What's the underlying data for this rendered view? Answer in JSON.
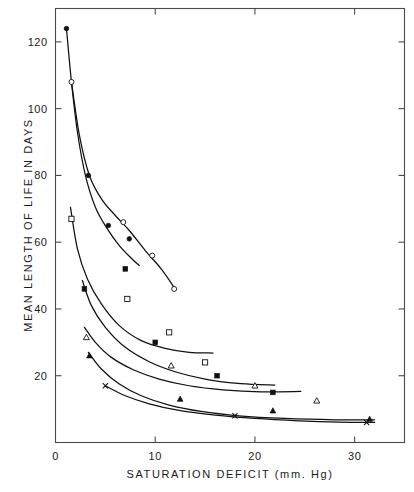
{
  "chart_data": {
    "type": "scatter",
    "title": "",
    "xlabel": "SATURATION DEFICIT  (mm. Hg)",
    "ylabel": "MEAN LENGTH OF LIFE IN DAYS",
    "xlim": [
      0,
      35
    ],
    "ylim": [
      0,
      130
    ],
    "grid": false,
    "legend": "none",
    "xticks": [
      0,
      10,
      20,
      30
    ],
    "xtick_labels": [
      "0",
      "10",
      "20",
      "30"
    ],
    "yticks": [
      20,
      40,
      60,
      80,
      100,
      120
    ],
    "ytick_labels": [
      "20",
      "40",
      "60",
      "80",
      "100",
      "120"
    ],
    "series": [
      {
        "name": "series-1",
        "marker": "filled-circle",
        "x": [
          1.1,
          3.3,
          5.3,
          7.4
        ],
        "y": [
          124.0,
          80.0,
          65.0,
          61.0
        ]
      },
      {
        "name": "series-2",
        "marker": "open-circle",
        "x": [
          1.6,
          6.8,
          9.7,
          11.9
        ],
        "y": [
          108.0,
          66.0,
          56.0,
          46.0
        ]
      },
      {
        "name": "series-3",
        "marker": "open-square",
        "x": [
          1.6,
          7.2,
          11.4,
          15.0
        ],
        "y": [
          67.0,
          43.0,
          33.0,
          24.0
        ]
      },
      {
        "name": "series-4",
        "marker": "filled-square",
        "x": [
          2.9,
          7.0,
          10.0,
          16.2,
          21.8
        ],
        "y": [
          46.0,
          52.0,
          30.0,
          20.0,
          15.0
        ]
      },
      {
        "name": "series-5",
        "marker": "open-triangle",
        "x": [
          3.1,
          11.6,
          20.0,
          26.2
        ],
        "y": [
          31.5,
          23.0,
          17.0,
          12.5
        ]
      },
      {
        "name": "series-6",
        "marker": "filled-triangle",
        "x": [
          3.4,
          12.5,
          21.8,
          31.5
        ],
        "y": [
          26.0,
          13.0,
          9.5,
          7.0
        ]
      },
      {
        "name": "series-7",
        "marker": "cross",
        "x": [
          5.0,
          18.0,
          31.2
        ],
        "y": [
          17.0,
          8.0,
          6.0
        ]
      }
    ],
    "curves": [
      {
        "name": "curve-1",
        "points": [
          [
            1.1,
            124.0
          ],
          [
            1.6,
            108.0
          ],
          [
            2.2,
            93.0
          ],
          [
            3.0,
            80.0
          ],
          [
            4.0,
            70.5
          ],
          [
            5.2,
            64.0
          ],
          [
            6.4,
            59.0
          ],
          [
            7.6,
            55.2
          ],
          [
            8.4,
            53.0
          ]
        ]
      },
      {
        "name": "curve-2",
        "points": [
          [
            1.6,
            108.0
          ],
          [
            2.4,
            92.0
          ],
          [
            3.4,
            80.0
          ],
          [
            4.6,
            73.0
          ],
          [
            6.0,
            68.0
          ],
          [
            7.4,
            63.5
          ],
          [
            9.0,
            57.5
          ],
          [
            10.6,
            52.0
          ],
          [
            12.0,
            46.0
          ]
        ]
      },
      {
        "name": "curve-3",
        "points": [
          [
            1.5,
            70.5
          ],
          [
            2.2,
            58.0
          ],
          [
            3.2,
            49.0
          ],
          [
            4.6,
            41.5
          ],
          [
            6.4,
            35.0
          ],
          [
            8.6,
            30.5
          ],
          [
            11.0,
            28.2
          ],
          [
            13.4,
            27.0
          ],
          [
            15.8,
            26.8
          ]
        ]
      },
      {
        "name": "curve-4",
        "points": [
          [
            2.7,
            48.5
          ],
          [
            3.6,
            41.0
          ],
          [
            5.0,
            34.5
          ],
          [
            7.0,
            28.5
          ],
          [
            9.4,
            24.2
          ],
          [
            12.0,
            21.2
          ],
          [
            15.0,
            19.0
          ],
          [
            18.6,
            17.6
          ],
          [
            22.0,
            17.2
          ]
        ]
      },
      {
        "name": "curve-5",
        "points": [
          [
            2.9,
            34.5
          ],
          [
            4.0,
            30.0
          ],
          [
            5.6,
            25.5
          ],
          [
            7.8,
            21.8
          ],
          [
            10.4,
            19.0
          ],
          [
            13.4,
            17.0
          ],
          [
            16.8,
            15.8
          ],
          [
            20.6,
            15.2
          ],
          [
            24.6,
            15.3
          ]
        ]
      },
      {
        "name": "curve-6",
        "points": [
          [
            3.3,
            27.0
          ],
          [
            4.6,
            22.0
          ],
          [
            6.4,
            17.5
          ],
          [
            8.6,
            14.0
          ],
          [
            11.4,
            11.2
          ],
          [
            14.6,
            9.3
          ],
          [
            18.4,
            8.0
          ],
          [
            23.0,
            7.2
          ],
          [
            28.0,
            6.8
          ],
          [
            32.0,
            6.8
          ]
        ]
      },
      {
        "name": "curve-7",
        "points": [
          [
            5.0,
            17.0
          ],
          [
            7.0,
            14.0
          ],
          [
            9.4,
            11.6
          ],
          [
            12.4,
            9.6
          ],
          [
            16.0,
            8.2
          ],
          [
            20.0,
            7.2
          ],
          [
            24.4,
            6.5
          ],
          [
            28.4,
            6.1
          ],
          [
            32.0,
            6.0
          ]
        ]
      }
    ]
  },
  "axes": {
    "x_title": "SATURATION  DEFICIT   (mm. Hg)",
    "y_title": "MEAN  LENGTH  OF  LIFE  IN  DAYS"
  }
}
